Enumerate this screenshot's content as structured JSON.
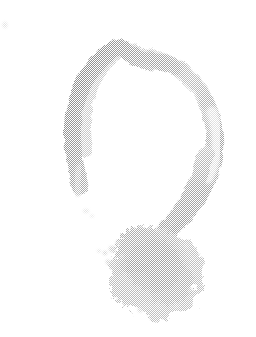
{
  "image": {
    "kind": "scanned-artwork",
    "subject": "question-mark",
    "style": "faded grayscale ink stamp with halftone dither texture",
    "alt_text": "A large faded grey question mark: an open C-shaped arc with a rough spiky ink blot as the dot",
    "width": 256,
    "height": 337,
    "background_color": "#ffffff"
  },
  "palette": {
    "background": "#ffffff",
    "stroke_dark": "#9a9a9a",
    "stroke_mid": "#b4b4b4",
    "stroke_light": "#d2d2d2",
    "stroke_faint": "#e8e8e8",
    "blot_core": "#a8a8a8",
    "blot_edge": "#c4c4c4",
    "speck": "#dcdcdc"
  },
  "elements": {
    "arc": {
      "name": "question-mark-arc",
      "description": "Open C-shaped hook, heaviest at upper-left, notch dip at top center, fading pale on the right flank",
      "start_point": [
        78,
        186
      ],
      "end_point": [
        168,
        232
      ],
      "notch_x": 118,
      "notch_y": 46
    },
    "tail": {
      "name": "question-mark-tail",
      "description": "Descending stroke from the right of the arc into the blot",
      "from": [
        215,
        150
      ],
      "to": [
        165,
        235
      ]
    },
    "blot": {
      "name": "question-mark-dot-blot",
      "description": "Rough spiky ink blot forming the dot of the question mark",
      "center": [
        152,
        268
      ],
      "radius_x": 46,
      "radius_y": 45,
      "bounds": [
        106,
        223,
        198,
        312
      ]
    },
    "specks": [
      {
        "name": "speck-top-left",
        "x": 5,
        "y": 25,
        "size": 4
      },
      {
        "name": "speck-mid-left",
        "x": 86,
        "y": 211,
        "size": 5
      },
      {
        "name": "speck-blot-left",
        "x": 99,
        "y": 252,
        "size": 3
      }
    ]
  },
  "chart_data": null
}
